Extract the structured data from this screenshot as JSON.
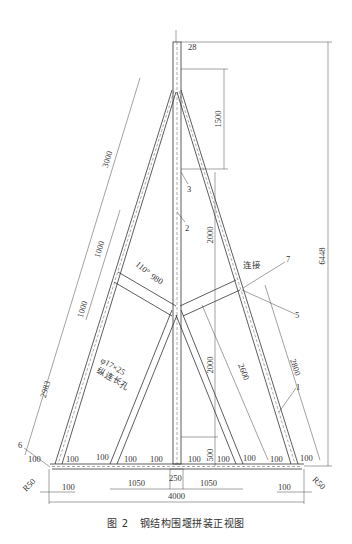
{
  "figure": {
    "caption_number": "图 2",
    "caption_title": "钢结构围堰拼装正视图"
  },
  "dimensions": {
    "top_offset": "28",
    "total_height": "6448",
    "upper_span": "1500",
    "middle_span": "2000",
    "lower_span": "2000",
    "base_offset": "500",
    "left_leg_top": "3000",
    "left_upper_segment": "1000",
    "left_lower_segment": "1000",
    "left_leg_bottom": "2983",
    "brace_length": "980",
    "brace_angle": "110°",
    "inner_diagonal": "2600",
    "outer_right": "2800",
    "base_total": "4000",
    "base_center": "250",
    "base_left_inner": "1050",
    "base_right_inner": "1050",
    "base_left_edge": "100",
    "base_right_edge": "100",
    "foot_spacing": [
      "100",
      "100",
      "100",
      "100",
      "100",
      "100",
      "100",
      "100",
      "100",
      "100"
    ],
    "radius_left": "R50",
    "radius_right": "R50"
  },
  "annotations": {
    "hole_spec": "φ17×25",
    "hole_desc": "纵连长孔",
    "connect_label": "连接"
  },
  "part_labels": {
    "p1": "1",
    "p2": "2",
    "p3": "3",
    "p5": "5",
    "p6": "6",
    "p7": "7"
  }
}
